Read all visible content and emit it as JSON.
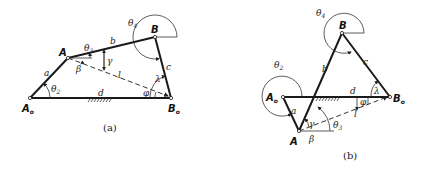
{
  "figure_a": {
    "caption": "(a)",
    "points": {
      "A0": "A",
      "A": "A",
      "B": "B",
      "B0": "B"
    },
    "point_subs": {
      "A0": "o",
      "B0": "o"
    },
    "links": {
      "a": "a",
      "b": "b",
      "c": "c",
      "d": "d",
      "l": "l"
    },
    "angles": {
      "theta2": "θ",
      "theta2_sub": "2",
      "theta3": "θ",
      "theta3_sub": "3",
      "theta4": "θ",
      "theta4_sub": "4",
      "gamma": "γ",
      "beta": "β",
      "lambda": "λ",
      "phi": "φ"
    }
  },
  "figure_b": {
    "caption": "(b)",
    "points": {
      "A0": "A",
      "A": "A",
      "B": "B",
      "B0": "B"
    },
    "point_subs": {
      "A0": "o",
      "B0": "o"
    },
    "links": {
      "a": "a",
      "b": "b",
      "c": "c",
      "d": "d",
      "l": "l"
    },
    "angles": {
      "theta2": "θ",
      "theta2_sub": "2",
      "theta3": "θ",
      "theta3_sub": "3",
      "theta4": "θ",
      "theta4_sub": "4",
      "gamma": "γ",
      "beta": "β",
      "lambda": "λ",
      "phi": "φ"
    }
  }
}
